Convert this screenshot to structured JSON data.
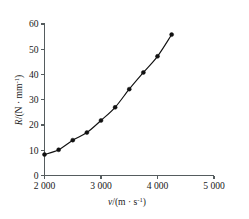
{
  "chart_data": {
    "type": "line",
    "title": "",
    "xlabel": "v/(m·s⁻¹)",
    "ylabel": "R/(N·mm⁻¹)",
    "xlabel_parts": {
      "symbol": "v",
      "unit_base": "/(m · s",
      "unit_exp": "-1",
      "unit_close": ")"
    },
    "ylabel_parts": {
      "symbol": "R",
      "unit_base": "/(N · mm",
      "unit_exp": "-1",
      "unit_close": ")"
    },
    "xlim": [
      2000,
      5000
    ],
    "ylim": [
      0,
      60
    ],
    "xticks": [
      2000,
      3000,
      4000,
      5000
    ],
    "xtick_labels": [
      "2 000",
      "3 000",
      "4 000",
      "5 000"
    ],
    "yticks": [
      0,
      10,
      20,
      30,
      40,
      50,
      60
    ],
    "ytick_labels": [
      "0",
      "10",
      "20",
      "30",
      "40",
      "50",
      "60"
    ],
    "grid": false,
    "legend": null,
    "marker": "filled-circle",
    "line_color": "#111111",
    "x": [
      2000,
      2250,
      2500,
      2750,
      3000,
      3250,
      3500,
      3750,
      4000,
      4250
    ],
    "y": [
      8.3,
      10.2,
      14.0,
      17.0,
      21.8,
      27.0,
      34.2,
      40.8,
      47.2,
      55.8
    ],
    "points": [
      {
        "x": 2000,
        "y": 8.3
      },
      {
        "x": 2250,
        "y": 10.2
      },
      {
        "x": 2500,
        "y": 14.0
      },
      {
        "x": 2750,
        "y": 17.0
      },
      {
        "x": 3000,
        "y": 21.8
      },
      {
        "x": 3250,
        "y": 27.0
      },
      {
        "x": 3500,
        "y": 34.2
      },
      {
        "x": 3750,
        "y": 40.8
      },
      {
        "x": 4000,
        "y": 47.2
      },
      {
        "x": 4250,
        "y": 55.8
      }
    ]
  }
}
